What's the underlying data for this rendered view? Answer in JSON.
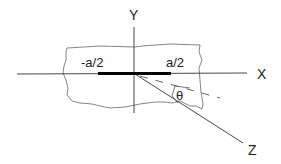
{
  "diagram": {
    "type": "coordinate-axes-strip",
    "axes": {
      "x_label": "X",
      "y_label": "Y",
      "z_label": "Z"
    },
    "strip": {
      "left_label": "-a/2",
      "right_label": "a/2"
    },
    "angle": {
      "label": "θ"
    },
    "colors": {
      "line": "#333333",
      "bar": "#000000",
      "background": "#ffffff"
    }
  }
}
